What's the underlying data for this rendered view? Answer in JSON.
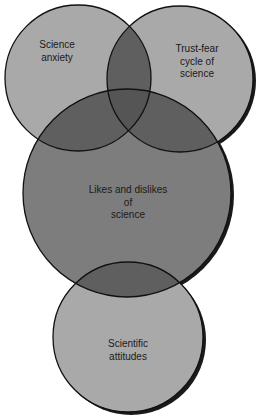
{
  "diagram": {
    "type": "venn",
    "colors": {
      "background": "#ffffff",
      "circle_fill": "#a9a9a9",
      "center_circle_fill": "#7d7d7d",
      "overlap_fill": "#5f5f5f",
      "triple_overlap_fill": "#555555",
      "stroke": "#111111",
      "shadow": "#1a1a1a",
      "text": "#1a1a1a"
    },
    "circles": [
      {
        "id": "science-anxiety",
        "lines": [
          "Science",
          "anxiety"
        ]
      },
      {
        "id": "trust-fear-cycle",
        "lines": [
          "Trust-fear",
          "cycle of",
          "science"
        ]
      },
      {
        "id": "likes-and-dislikes",
        "lines": [
          "Likes and dislikes",
          "of",
          "science"
        ]
      },
      {
        "id": "scientific-attitudes",
        "lines": [
          "Scientific",
          "attitudes"
        ]
      }
    ]
  }
}
